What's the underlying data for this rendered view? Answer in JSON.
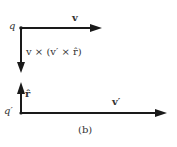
{
  "figure": {
    "caption": "(b)",
    "colors": {
      "stroke": "#1a1a1a",
      "text": "#333333",
      "background": "#ffffff"
    },
    "top_diagram": {
      "point_label": "q",
      "horizontal_vector_label": "v",
      "downward_vector_label": "v × (v′ × r̂)"
    },
    "bottom_diagram": {
      "point_label": "q′",
      "upward_vector_label": "r̂",
      "horizontal_vector_label": "v′"
    }
  }
}
